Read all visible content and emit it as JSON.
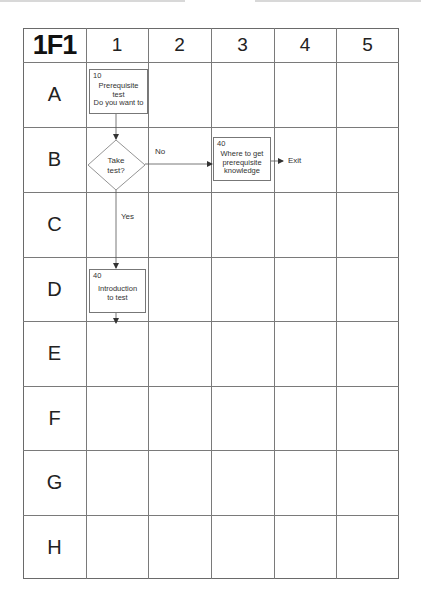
{
  "sheet": {
    "id_label": "1F1",
    "columns": [
      "1",
      "2",
      "3",
      "4",
      "5"
    ],
    "rows": [
      "A",
      "B",
      "C",
      "D",
      "E",
      "F",
      "G",
      "H"
    ]
  },
  "nodes": {
    "a1": {
      "cell": "A1",
      "type": "process",
      "number": "10",
      "text": "Prerequisite\ntest\nDo you want to"
    },
    "b1": {
      "cell": "B1",
      "type": "decision",
      "text": "Take\ntest?"
    },
    "b3": {
      "cell": "B3",
      "type": "process",
      "number": "40",
      "text": "Where to get\nprerequisite\nknowledge"
    },
    "d1": {
      "cell": "D1",
      "type": "process",
      "number": "40",
      "text": "Introduction\nto test"
    }
  },
  "connectors": {
    "no_label": "No",
    "yes_label": "Yes",
    "exit_label": "Exit"
  },
  "colors": {
    "grid_line": "#7a7a7a",
    "box_border": "#777777",
    "text": "#333333",
    "background": "#ffffff"
  }
}
